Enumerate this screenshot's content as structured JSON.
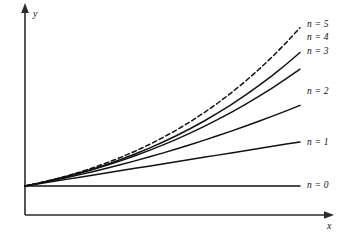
{
  "figure": {
    "background_color": "#ffffff",
    "stroke_color": "#111111",
    "axis_color": "#2b2b2b",
    "width": 342,
    "height": 233
  },
  "axes": {
    "x_label": "x",
    "y_label": "y",
    "x_label_name": "x-axis-label",
    "y_label_name": "y-axis-label",
    "origin_x": 25,
    "origin_y": 186,
    "x_axis_y": 215,
    "y_axis_top": 5,
    "x_axis_right": 332
  },
  "labels": {
    "n0": "n = 0",
    "n1": "n = 1",
    "n2": "n = 2",
    "n3": "n = 3",
    "n4": "n = 4",
    "n5": "n = 5"
  },
  "chart_data": {
    "type": "line",
    "title": "",
    "xlabel": "x",
    "ylabel": "y",
    "grid": false,
    "legend_position": "right-of-curve-ends",
    "xlim": [
      0,
      1
    ],
    "ylim": [
      0,
      1
    ],
    "x": [
      0.0,
      0.05,
      0.1,
      0.15,
      0.2,
      0.25,
      0.3,
      0.35,
      0.4,
      0.45,
      0.5,
      0.55,
      0.6,
      0.65,
      0.7,
      0.75,
      0.8,
      0.85,
      0.9,
      0.95,
      1.0
    ],
    "series": [
      {
        "name": "n = 0",
        "label": "n = 0",
        "linestyle": "solid",
        "color": "#111111",
        "values": [
          0.0,
          0.0,
          0.0,
          0.0,
          0.0,
          0.0,
          0.0,
          0.0,
          0.0,
          0.0,
          0.0,
          0.0,
          0.0,
          0.0,
          0.0,
          0.0,
          0.0,
          0.0,
          0.0,
          0.0,
          0.0
        ]
      },
      {
        "name": "n = 1",
        "label": "n = 1",
        "linestyle": "solid",
        "color": "#111111",
        "values": [
          0.0,
          0.0137,
          0.0274,
          0.0411,
          0.0548,
          0.0685,
          0.0822,
          0.0959,
          0.1096,
          0.1233,
          0.137,
          0.1507,
          0.1644,
          0.1781,
          0.1918,
          0.2055,
          0.2192,
          0.2329,
          0.2466,
          0.2603,
          0.274
        ]
      },
      {
        "name": "n = 2",
        "label": "n = 2",
        "linestyle": "solid",
        "color": "#111111",
        "values": [
          0.0,
          0.0163,
          0.0335,
          0.0516,
          0.0707,
          0.0906,
          0.1115,
          0.1333,
          0.156,
          0.1797,
          0.2042,
          0.2297,
          0.2561,
          0.2834,
          0.3117,
          0.3409,
          0.371,
          0.402,
          0.4339,
          0.4668,
          0.5006
        ]
      },
      {
        "name": "n = 3",
        "label": "n = 3",
        "linestyle": "solid",
        "color": "#111111",
        "values": [
          0.0,
          0.0175,
          0.0366,
          0.0573,
          0.0797,
          0.1039,
          0.1299,
          0.1578,
          0.1877,
          0.2196,
          0.2536,
          0.2898,
          0.3282,
          0.369,
          0.4121,
          0.4577,
          0.5059,
          0.5566,
          0.6101,
          0.6663,
          0.7253
        ]
      },
      {
        "name": "n = 4",
        "label": "n = 4",
        "linestyle": "solid",
        "color": "#111111",
        "values": [
          0.0,
          0.0178,
          0.0374,
          0.0589,
          0.0824,
          0.108,
          0.1358,
          0.1659,
          0.1985,
          0.2336,
          0.2714,
          0.312,
          0.3556,
          0.4023,
          0.4522,
          0.5055,
          0.5624,
          0.623,
          0.6876,
          0.7562,
          0.8291
        ]
      },
      {
        "name": "n = 5",
        "label": "n = 5",
        "linestyle": "dashed",
        "color": "#111111",
        "values": [
          0.0,
          0.0183,
          0.0388,
          0.0616,
          0.0869,
          0.1148,
          0.1455,
          0.1791,
          0.2159,
          0.256,
          0.2996,
          0.347,
          0.3983,
          0.4539,
          0.5139,
          0.5786,
          0.6483,
          0.7233,
          0.8039,
          0.8904,
          0.9831
        ]
      }
    ],
    "annotations": [
      {
        "text": "n = 0",
        "series": "n = 0"
      },
      {
        "text": "n = 1",
        "series": "n = 1"
      },
      {
        "text": "n = 2",
        "series": "n = 2"
      },
      {
        "text": "n = 3",
        "series": "n = 3"
      },
      {
        "text": "n = 4",
        "series": "n = 4"
      },
      {
        "text": "n = 5",
        "series": "n = 5"
      }
    ]
  }
}
